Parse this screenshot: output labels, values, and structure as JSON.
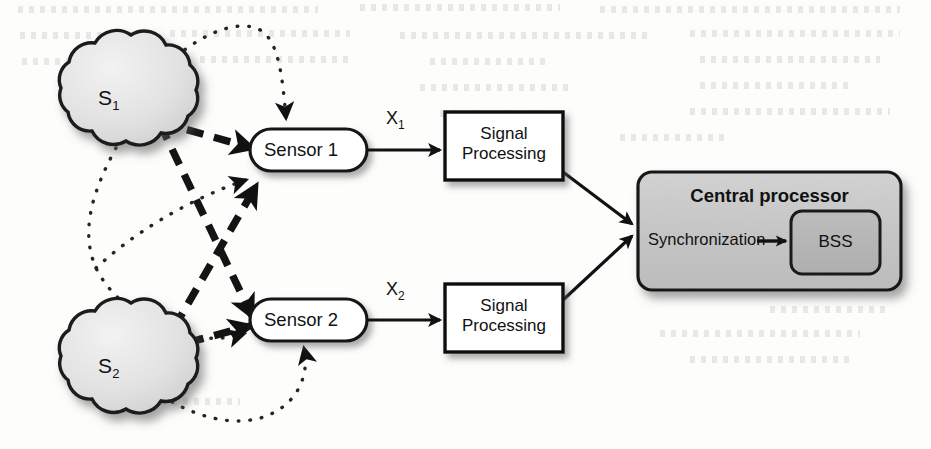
{
  "figure": {
    "type": "block-diagram"
  },
  "sources": [
    {
      "id": "s1",
      "label": "S",
      "sub": "1",
      "shape": "cloud",
      "x": 113,
      "y": 98
    },
    {
      "id": "s2",
      "label": "S",
      "sub": "2",
      "shape": "cloud",
      "x": 113,
      "y": 366
    }
  ],
  "sensors": [
    {
      "id": "sensor1",
      "label": "Sensor 1",
      "shape": "stadium",
      "x": 308,
      "y": 150
    },
    {
      "id": "sensor2",
      "label": "Sensor 2",
      "shape": "stadium",
      "x": 308,
      "y": 320
    }
  ],
  "signal_blocks": [
    {
      "id": "sp1",
      "line1": "Signal",
      "line2": "Processing",
      "shape": "rect",
      "x": 504,
      "y": 146
    },
    {
      "id": "sp2",
      "line1": "Signal",
      "line2": "Processing",
      "shape": "rect",
      "x": 504,
      "y": 318
    }
  ],
  "signal_labels": [
    {
      "id": "x1",
      "label": "X",
      "sub": "1",
      "x": 394,
      "y": 120
    },
    {
      "id": "x2",
      "label": "X",
      "sub": "2",
      "x": 394,
      "y": 292
    }
  ],
  "central_processor": {
    "title": "Central processor",
    "sync_label": "Synchronization",
    "bss_label": "BSS",
    "fill": "#c6c6c6",
    "inner_fill": "#b3b3b3"
  },
  "edges": {
    "direct": {
      "style": "dashed",
      "semantic": "direct-path",
      "stroke": "#1a1a1a",
      "width": 7,
      "dash": "17 11",
      "paths": [
        {
          "from": "s1",
          "to": "sensor1"
        },
        {
          "from": "s1",
          "to": "sensor2"
        },
        {
          "from": "s2",
          "to": "sensor1"
        },
        {
          "from": "s2",
          "to": "sensor2"
        }
      ]
    },
    "reflected": {
      "style": "dotted",
      "semantic": "reflected-path",
      "stroke": "#2a2a2a",
      "width": 3.4,
      "dash": "0.6 11",
      "paths": [
        {
          "from": "s1",
          "to": "sensor1"
        },
        {
          "from": "s1",
          "to": "sensor2"
        },
        {
          "from": "s2",
          "to": "sensor1"
        },
        {
          "from": "s2",
          "to": "sensor2"
        }
      ]
    },
    "solid": {
      "style": "solid",
      "stroke": "#111111",
      "width": 3,
      "paths": [
        {
          "from": "sensor1",
          "to": "sp1",
          "label": "X1"
        },
        {
          "from": "sensor2",
          "to": "sp2",
          "label": "X2"
        },
        {
          "from": "sp1",
          "to": "central_processor"
        },
        {
          "from": "sp2",
          "to": "central_processor"
        },
        {
          "from": "sync",
          "to": "bss"
        }
      ]
    }
  },
  "bleed_text_rows": [
    {
      "x": 18,
      "y": 6,
      "w": 300
    },
    {
      "x": 360,
      "y": 4,
      "w": 200
    },
    {
      "x": 600,
      "y": 6,
      "w": 300
    },
    {
      "x": 20,
      "y": 32,
      "w": 120
    },
    {
      "x": 170,
      "y": 30,
      "w": 180
    },
    {
      "x": 400,
      "y": 32,
      "w": 250
    },
    {
      "x": 690,
      "y": 30,
      "w": 210
    },
    {
      "x": 22,
      "y": 58,
      "w": 110
    },
    {
      "x": 200,
      "y": 56,
      "w": 150
    },
    {
      "x": 430,
      "y": 58,
      "w": 120
    },
    {
      "x": 700,
      "y": 56,
      "w": 180
    },
    {
      "x": 420,
      "y": 84,
      "w": 150
    },
    {
      "x": 700,
      "y": 82,
      "w": 150
    },
    {
      "x": 440,
      "y": 110,
      "w": 120
    },
    {
      "x": 690,
      "y": 108,
      "w": 200
    },
    {
      "x": 620,
      "y": 134,
      "w": 110
    },
    {
      "x": 770,
      "y": 306,
      "w": 120
    },
    {
      "x": 660,
      "y": 330,
      "w": 200
    },
    {
      "x": 690,
      "y": 356,
      "w": 160
    },
    {
      "x": 150,
      "y": 398,
      "w": 90
    }
  ]
}
